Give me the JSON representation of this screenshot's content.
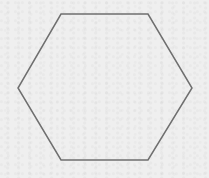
{
  "figure": {
    "shape": "hexagon",
    "orientation": "flat-top",
    "vertices": [
      [
        61,
        14
      ],
      [
        148,
        14
      ],
      [
        192,
        88
      ],
      [
        148,
        160
      ],
      [
        61,
        160
      ],
      [
        18,
        88
      ]
    ],
    "stroke_color": "#6f6f6f",
    "stroke_width": 1.5,
    "fill": "none"
  },
  "background": {
    "color": "#efefef",
    "texture": "paper"
  }
}
